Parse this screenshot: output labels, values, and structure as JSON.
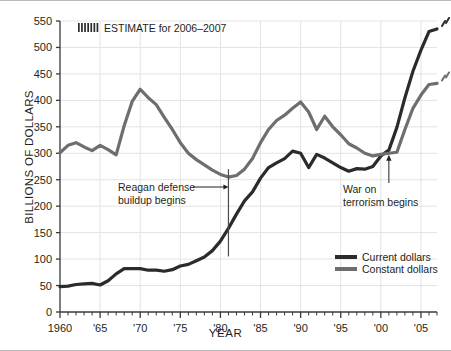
{
  "figure": {
    "ylabel": "BILLIONS OF DOLLARS",
    "xlabel": "YEAR",
    "estimate_note": "ESTIMATE for 2006–2007"
  },
  "annotations": {
    "reagan_line1": "Reagan defense",
    "reagan_line2": "buildup begins",
    "war_line1": "War on",
    "war_line2": "terrorism begins"
  },
  "legend": {
    "current": "Current dollars",
    "constant": "Constant dollars"
  },
  "colors": {
    "current": "#2b2b2b",
    "constant": "#6e6e6e",
    "grid": "#e3e3e3",
    "axis": "#3a3a3a",
    "frame": "#b9b9b9"
  },
  "chart_data": {
    "type": "line",
    "title": "",
    "xlabel": "YEAR",
    "ylabel": "BILLIONS OF DOLLARS",
    "xlim": [
      1960,
      2007
    ],
    "ylim": [
      0,
      550
    ],
    "ytick_step": 50,
    "yticks": [
      0,
      50,
      100,
      150,
      200,
      250,
      300,
      350,
      400,
      450,
      500,
      550
    ],
    "xticks": [
      1960,
      1965,
      1970,
      1975,
      1980,
      1985,
      1990,
      1995,
      2000,
      2005
    ],
    "xticklabels": [
      "1960",
      "'65",
      "'70",
      "'75",
      "'80",
      "'85",
      "'90",
      "'95",
      "'00",
      "'05"
    ],
    "grid": true,
    "legend_position": "bottom-right",
    "annotations": [
      {
        "text": "ESTIMATE for 2006–2007",
        "x": 1963,
        "y": 527,
        "marker": "hatch"
      },
      {
        "text": "Reagan defense buildup begins",
        "x": 1972,
        "y": 205,
        "arrow_to_x": 1981,
        "arrow_to_y": 205
      },
      {
        "text": "War on terrorism begins",
        "x": 1993,
        "y": 195,
        "arrow_to_x": 2001,
        "arrow_to_y": 272
      }
    ],
    "x": [
      1960,
      1961,
      1962,
      1963,
      1964,
      1965,
      1966,
      1967,
      1968,
      1969,
      1970,
      1971,
      1972,
      1973,
      1974,
      1975,
      1976,
      1977,
      1978,
      1979,
      1980,
      1981,
      1982,
      1983,
      1984,
      1985,
      1986,
      1987,
      1988,
      1989,
      1990,
      1991,
      1992,
      1993,
      1994,
      1995,
      1996,
      1997,
      1998,
      1999,
      2000,
      2001,
      2002,
      2003,
      2004,
      2005,
      2006,
      2007
    ],
    "series": [
      {
        "name": "Current dollars",
        "color": "#2b2b2b",
        "values": [
          48,
          49,
          52,
          53,
          54,
          51,
          59,
          72,
          82,
          82,
          82,
          79,
          79,
          77,
          80,
          87,
          90,
          97,
          104,
          116,
          134,
          158,
          185,
          210,
          227,
          253,
          273,
          282,
          290,
          304,
          300,
          273,
          298,
          291,
          282,
          273,
          266,
          271,
          270,
          275,
          295,
          306,
          349,
          405,
          455,
          495,
          530,
          535
        ]
      },
      {
        "name": "Constant dollars",
        "color": "#6e6e6e",
        "values": [
          301,
          315,
          320,
          312,
          305,
          315,
          307,
          297,
          352,
          398,
          421,
          405,
          392,
          368,
          345,
          320,
          300,
          288,
          278,
          268,
          260,
          255,
          258,
          270,
          290,
          320,
          345,
          362,
          372,
          385,
          397,
          378,
          345,
          370,
          350,
          335,
          318,
          310,
          300,
          295,
          298,
          300,
          302,
          345,
          385,
          410,
          430,
          432
        ]
      }
    ],
    "estimate_start_year": 2006
  }
}
